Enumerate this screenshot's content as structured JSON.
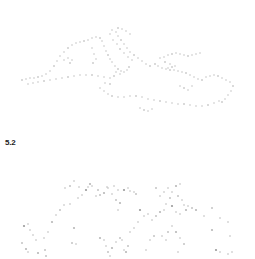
{
  "figure": {
    "label": "5.2",
    "dot_color": "#b8b8b8",
    "dot_color_dark": "#9a9a9a",
    "panels": [
      {
        "name": "dotted-coastline-map",
        "description": "Dotted outline of the Mediterranean coastline",
        "dots": [
          [
            22,
            80
          ],
          [
            26,
            79
          ],
          [
            30,
            78
          ],
          [
            34,
            78
          ],
          [
            38,
            77
          ],
          [
            42,
            76
          ],
          [
            46,
            74
          ],
          [
            50,
            71
          ],
          [
            54,
            66
          ],
          [
            57,
            61
          ],
          [
            60,
            56
          ],
          [
            64,
            52
          ],
          [
            68,
            48
          ],
          [
            72,
            45
          ],
          [
            76,
            43
          ],
          [
            80,
            42
          ],
          [
            84,
            41
          ],
          [
            88,
            40
          ],
          [
            92,
            38
          ],
          [
            96,
            37
          ],
          [
            100,
            38
          ],
          [
            102,
            41
          ],
          [
            104,
            46
          ],
          [
            106,
            51
          ],
          [
            108,
            55
          ],
          [
            110,
            59
          ],
          [
            112,
            62
          ],
          [
            115,
            66
          ],
          [
            118,
            69
          ],
          [
            121,
            71
          ],
          [
            124,
            72
          ],
          [
            127,
            70
          ],
          [
            129,
            67
          ],
          [
            28,
            84
          ],
          [
            33,
            83
          ],
          [
            38,
            82
          ],
          [
            44,
            81
          ],
          [
            50,
            80
          ],
          [
            56,
            79
          ],
          [
            62,
            78
          ],
          [
            68,
            77
          ],
          [
            74,
            76
          ],
          [
            80,
            75
          ],
          [
            86,
            75
          ],
          [
            92,
            75
          ],
          [
            98,
            76
          ],
          [
            104,
            77
          ],
          [
            110,
            78
          ],
          [
            114,
            76
          ],
          [
            64,
            60
          ],
          [
            68,
            58
          ],
          [
            72,
            60
          ],
          [
            70,
            63
          ],
          [
            92,
            48
          ],
          [
            94,
            54
          ],
          [
            96,
            59
          ],
          [
            93,
            63
          ],
          [
            112,
            30
          ],
          [
            116,
            32
          ],
          [
            118,
            36
          ],
          [
            121,
            40
          ],
          [
            124,
            44
          ],
          [
            127,
            48
          ],
          [
            130,
            52
          ],
          [
            134,
            55
          ],
          [
            138,
            58
          ],
          [
            142,
            61
          ],
          [
            146,
            64
          ],
          [
            150,
            66
          ],
          [
            110,
            34
          ],
          [
            113,
            40
          ],
          [
            117,
            44
          ],
          [
            120,
            49
          ],
          [
            124,
            53
          ],
          [
            128,
            57
          ],
          [
            132,
            60
          ],
          [
            118,
            28
          ],
          [
            122,
            29
          ],
          [
            126,
            31
          ],
          [
            130,
            34
          ],
          [
            155,
            64
          ],
          [
            158,
            66
          ],
          [
            162,
            68
          ],
          [
            166,
            69
          ],
          [
            170,
            70
          ],
          [
            174,
            70
          ],
          [
            178,
            71
          ],
          [
            182,
            72
          ],
          [
            186,
            73
          ],
          [
            190,
            75
          ],
          [
            194,
            77
          ],
          [
            198,
            79
          ],
          [
            202,
            80
          ],
          [
            160,
            58
          ],
          [
            164,
            57
          ],
          [
            168,
            55
          ],
          [
            172,
            54
          ],
          [
            176,
            53
          ],
          [
            180,
            54
          ],
          [
            184,
            55
          ],
          [
            188,
            56
          ],
          [
            192,
            55
          ],
          [
            196,
            54
          ],
          [
            200,
            53
          ],
          [
            165,
            62
          ],
          [
            170,
            64
          ],
          [
            175,
            66
          ],
          [
            168,
            68
          ],
          [
            172,
            67
          ],
          [
            206,
            77
          ],
          [
            210,
            76
          ],
          [
            214,
            75
          ],
          [
            218,
            76
          ],
          [
            222,
            78
          ],
          [
            226,
            80
          ],
          [
            230,
            82
          ],
          [
            233,
            86
          ],
          [
            231,
            91
          ],
          [
            228,
            95
          ],
          [
            225,
            99
          ],
          [
            222,
            102
          ],
          [
            100,
            88
          ],
          [
            104,
            91
          ],
          [
            108,
            94
          ],
          [
            112,
            96
          ],
          [
            118,
            97
          ],
          [
            124,
            97
          ],
          [
            130,
            96
          ],
          [
            136,
            96
          ],
          [
            142,
            97
          ],
          [
            148,
            99
          ],
          [
            154,
            100
          ],
          [
            160,
            101
          ],
          [
            166,
            102
          ],
          [
            172,
            103
          ],
          [
            178,
            104
          ],
          [
            184,
            104
          ],
          [
            190,
            105
          ],
          [
            196,
            106
          ],
          [
            202,
            106
          ],
          [
            208,
            105
          ],
          [
            214,
            103
          ],
          [
            219,
            101
          ],
          [
            140,
            108
          ],
          [
            144,
            110
          ],
          [
            148,
            111
          ],
          [
            152,
            109
          ],
          [
            105,
            83
          ],
          [
            110,
            84
          ],
          [
            116,
            72
          ],
          [
            120,
            74
          ],
          [
            180,
            86
          ],
          [
            184,
            88
          ],
          [
            188,
            90
          ],
          [
            192,
            86
          ]
        ]
      },
      {
        "name": "dot-scatter-field",
        "description": "Scatter of grey dots forming an arch-like distribution",
        "dots": [
          [
            24,
            226
          ],
          [
            28,
            224
          ],
          [
            30,
            230
          ],
          [
            33,
            235
          ],
          [
            22,
            243
          ],
          [
            26,
            249
          ],
          [
            36,
            240
          ],
          [
            44,
            238
          ],
          [
            45,
            250
          ],
          [
            48,
            232
          ],
          [
            52,
            222
          ],
          [
            56,
            215
          ],
          [
            60,
            210
          ],
          [
            64,
            205
          ],
          [
            70,
            204
          ],
          [
            74,
            228
          ],
          [
            72,
            243
          ],
          [
            76,
            244
          ],
          [
            78,
            198
          ],
          [
            82,
            195
          ],
          [
            86,
            190
          ],
          [
            88,
            187
          ],
          [
            92,
            186
          ],
          [
            96,
            196
          ],
          [
            100,
            195
          ],
          [
            104,
            193
          ],
          [
            108,
            188
          ],
          [
            112,
            194
          ],
          [
            116,
            200
          ],
          [
            118,
            210
          ],
          [
            120,
            203
          ],
          [
            65,
            188
          ],
          [
            70,
            186
          ],
          [
            74,
            181
          ],
          [
            79,
            187
          ],
          [
            90,
            184
          ],
          [
            98,
            190
          ],
          [
            107,
            187
          ],
          [
            114,
            186
          ],
          [
            118,
            190
          ],
          [
            124,
            190
          ],
          [
            128,
            188
          ],
          [
            130,
            191
          ],
          [
            134,
            192
          ],
          [
            136,
            194
          ],
          [
            100,
            238
          ],
          [
            104,
            240
          ],
          [
            106,
            246
          ],
          [
            108,
            252
          ],
          [
            110,
            256
          ],
          [
            112,
            248
          ],
          [
            116,
            242
          ],
          [
            120,
            238
          ],
          [
            122,
            240
          ],
          [
            124,
            250
          ],
          [
            126,
            252
          ],
          [
            128,
            246
          ],
          [
            130,
            232
          ],
          [
            134,
            228
          ],
          [
            138,
            222
          ],
          [
            140,
            210
          ],
          [
            144,
            216
          ],
          [
            148,
            214
          ],
          [
            152,
            220
          ],
          [
            156,
            216
          ],
          [
            160,
            212
          ],
          [
            164,
            210
          ],
          [
            166,
            204
          ],
          [
            170,
            198
          ],
          [
            172,
            192
          ],
          [
            176,
            186
          ],
          [
            180,
            184
          ],
          [
            178,
            196
          ],
          [
            182,
            200
          ],
          [
            184,
            205
          ],
          [
            186,
            210
          ],
          [
            156,
            188
          ],
          [
            160,
            196
          ],
          [
            164,
            192
          ],
          [
            168,
            188
          ],
          [
            172,
            206
          ],
          [
            176,
            212
          ],
          [
            180,
            214
          ],
          [
            188,
            206
          ],
          [
            192,
            208
          ],
          [
            196,
            210
          ],
          [
            162,
            236
          ],
          [
            166,
            240
          ],
          [
            168,
            232
          ],
          [
            172,
            226
          ],
          [
            176,
            232
          ],
          [
            180,
            238
          ],
          [
            184,
            244
          ],
          [
            178,
            252
          ],
          [
            204,
            216
          ],
          [
            212,
            230
          ],
          [
            212,
            208
          ],
          [
            220,
            218
          ],
          [
            228,
            222
          ],
          [
            230,
            236
          ],
          [
            216,
            250
          ],
          [
            220,
            252
          ],
          [
            228,
            254
          ],
          [
            232,
            252
          ],
          [
            46,
            256
          ],
          [
            38,
            253
          ],
          [
            28,
            252
          ],
          [
            150,
            240
          ],
          [
            154,
            236
          ],
          [
            146,
            250
          ]
        ]
      }
    ]
  }
}
